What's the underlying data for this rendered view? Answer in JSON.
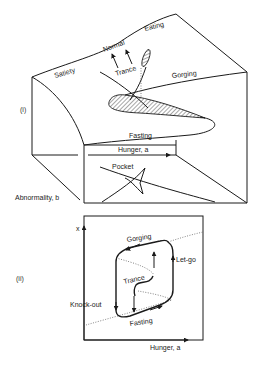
{
  "figure": {
    "panel_i": {
      "label": "(i)",
      "surface_labels": {
        "satiety": "Satiety",
        "eating": "Eating",
        "normal": "Normal",
        "trance": "Trance",
        "gorging": "Gorging",
        "fasting": "Fasting",
        "pocket": "Pocket"
      },
      "axes": {
        "x": "Hunger, a",
        "y": "Abnormality, b"
      }
    },
    "panel_ii": {
      "label": "(ii)",
      "labels": {
        "gorging": "Gorging",
        "let_go": "Let-go",
        "trance": "Trance",
        "knock_out": "Knock-out",
        "fasting": "Fasting"
      },
      "axes": {
        "x": "Hunger, a",
        "y": "x"
      }
    }
  }
}
